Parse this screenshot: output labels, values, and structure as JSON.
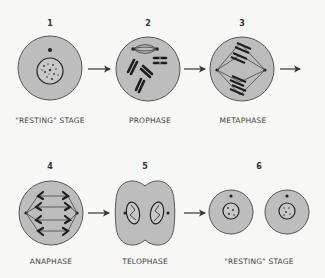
{
  "colors": {
    "cell": "#bdbdbd",
    "outline": "#555555",
    "ink": "#222222",
    "background": "#f7f7f5"
  },
  "stages": [
    {
      "number": "1",
      "label": "\"RESTING\" STAGE"
    },
    {
      "number": "2",
      "label": "PROPHASE"
    },
    {
      "number": "3",
      "label": "METAPHASE"
    },
    {
      "number": "4",
      "label": "ANAPHASE"
    },
    {
      "number": "5",
      "label": "TELOPHASE"
    },
    {
      "number": "6",
      "label": "\"RESTING\"  STAGE"
    }
  ],
  "arrows": [
    {
      "from": "1",
      "to": "2",
      "icon": "right-arrow-icon"
    },
    {
      "from": "2",
      "to": "3",
      "icon": "right-arrow-icon"
    },
    {
      "from": "3",
      "to": "4",
      "icon": "right-arrow-icon"
    },
    {
      "from": "4",
      "to": "5",
      "icon": "right-arrow-icon"
    },
    {
      "from": "5",
      "to": "6",
      "icon": "right-arrow-icon"
    }
  ]
}
